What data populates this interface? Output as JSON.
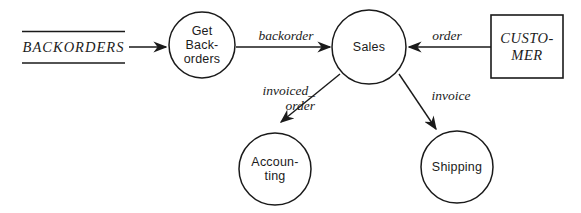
{
  "colors": {
    "ink": "#1a1a1a",
    "background": "#ffffff"
  },
  "data_store": {
    "label": "BACKORDERS"
  },
  "processes": {
    "get_backorders": {
      "line1": "Get",
      "line2": "Back-",
      "line3": "orders"
    },
    "sales": {
      "label": "Sales"
    },
    "accounting": {
      "line1": "Accoun-",
      "line2": "ting"
    },
    "shipping": {
      "label": "Shipping"
    }
  },
  "external_entity": {
    "line1": "CUSTO-",
    "line2": "MER"
  },
  "flows": {
    "backorder": {
      "label": "backorder"
    },
    "order": {
      "label": "order"
    },
    "invoiced_order": {
      "line1": "invoiced_",
      "line2": "order"
    },
    "invoice": {
      "label": "invoice"
    }
  }
}
